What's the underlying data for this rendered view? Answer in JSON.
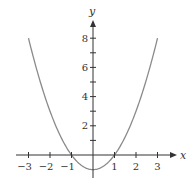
{
  "chart_data": {
    "type": "line",
    "title": "",
    "xlabel": "x",
    "ylabel": "y",
    "function": "y = x^2 - 1",
    "xlim": [
      -3.4,
      3.6
    ],
    "ylim": [
      -1.7,
      9.6
    ],
    "x_ticks": [
      -3,
      -2,
      -1,
      1,
      2,
      3
    ],
    "x_tick_labels": [
      "−3",
      "−2",
      "−1",
      "1",
      "2",
      "3"
    ],
    "y_ticks": [
      1,
      2,
      3,
      4,
      5,
      6,
      7,
      8
    ],
    "y_tick_labels": [
      "2",
      "4",
      "6",
      "8"
    ],
    "y_labeled_ticks": [
      2,
      4,
      6,
      8
    ],
    "grid": false,
    "series": [
      {
        "name": "parabola",
        "x": [
          -3,
          -2.5,
          -2,
          -1.5,
          -1,
          -0.5,
          0,
          0.5,
          1,
          1.5,
          2,
          2.5,
          3
        ],
        "y": [
          8,
          5.25,
          3,
          1.25,
          0,
          -0.75,
          -1,
          -0.75,
          0,
          1.25,
          3,
          5.25,
          8
        ]
      }
    ],
    "colors": {
      "curve": "#8a8a8a",
      "axis": "#333333"
    }
  }
}
